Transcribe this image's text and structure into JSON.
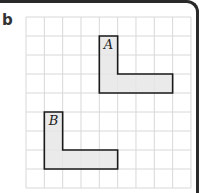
{
  "panel": {
    "label": "b"
  },
  "grid": {
    "cols": 9,
    "rows": 9,
    "x0": 26,
    "y0": 17,
    "cell_w": 18.33,
    "cell_h": 19,
    "line_color": "#d8d8d8"
  },
  "shapes": [
    {
      "name": "A",
      "fill": "#e6e6e6",
      "stroke": "#1a1a1a",
      "cells_polygon": [
        [
          4,
          1
        ],
        [
          5,
          1
        ],
        [
          5,
          3
        ],
        [
          8,
          3
        ],
        [
          8,
          4
        ],
        [
          4,
          4
        ]
      ]
    },
    {
      "name": "B",
      "fill": "#e6e6e6",
      "stroke": "#1a1a1a",
      "cells_polygon": [
        [
          1,
          5
        ],
        [
          2,
          5
        ],
        [
          2,
          7
        ],
        [
          5,
          7
        ],
        [
          5,
          8
        ],
        [
          1,
          8
        ]
      ]
    }
  ]
}
